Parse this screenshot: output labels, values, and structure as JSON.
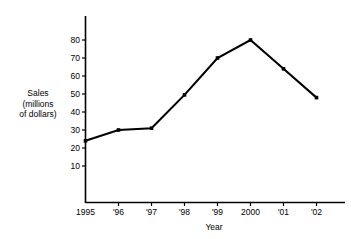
{
  "chart_data": {
    "type": "line",
    "title": "",
    "subtitle": "",
    "xlabel": "Year",
    "ylabel": "Sales\n(millions\nof dollars)",
    "categories": [
      "1995",
      "'96",
      "'97",
      "'98",
      "'99",
      "2000",
      "'01",
      "'02"
    ],
    "values": [
      24,
      30,
      31,
      49.5,
      70,
      80,
      64,
      48
    ],
    "series": [
      {
        "name": "Sales",
        "values": [
          24,
          30,
          31,
          49.5,
          70,
          80,
          64,
          48
        ]
      }
    ],
    "ylim": [
      0,
      85
    ],
    "yticks": [
      10,
      20,
      30,
      40,
      50,
      60,
      70,
      80
    ],
    "ytick_labels": [
      "10",
      "20",
      "30",
      "40",
      "50",
      "60",
      "70",
      "80"
    ],
    "xtick_labels": [
      "1995",
      "'96",
      "'97",
      "'98",
      "'99",
      "2000",
      "'01",
      "'02"
    ],
    "grid": false,
    "legend": "none",
    "line_color": "#000000",
    "marker": "square",
    "marker_color": "#000000",
    "background_color": "#ffffff"
  },
  "axes": {
    "y_title": "Sales\n(millions\nof dollars)",
    "x_title": "Year"
  }
}
